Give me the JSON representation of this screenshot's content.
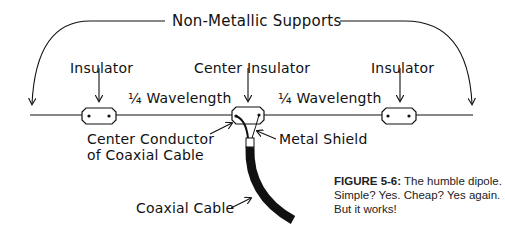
{
  "diagram": {
    "title": "Non-Metallic Supports",
    "labels": {
      "insulator_left": "Insulator",
      "center_insulator": "Center Insulator",
      "insulator_right": "Insulator",
      "quarter_wave_left": "¼ Wavelength",
      "quarter_wave_right": "¼ Wavelength",
      "center_conductor_line1": "Center Conductor",
      "center_conductor_line2": "of Coaxial Cable",
      "metal_shield": "Metal Shield",
      "coaxial_cable": "Coaxial Cable"
    }
  },
  "caption": {
    "figure_label": "FIGURE 5-6:",
    "text": " The humble dipole. Simple? Yes. Cheap? Yes again. But it works!"
  },
  "colors": {
    "ink": "#111111",
    "background": "#ffffff"
  }
}
